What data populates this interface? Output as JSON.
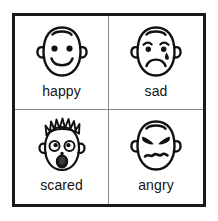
{
  "page": {
    "background_color": "#ffffff",
    "frame_color": "#1a1a1a",
    "divider_color": "#8a8a8a",
    "ink_color": "#111111",
    "layout": "2x2 grid"
  },
  "grid": {
    "columns": 2,
    "rows": 2,
    "cells": [
      {
        "id": "happy",
        "label": "happy",
        "icon_name": "happy-face-icon",
        "position": "top-left",
        "features": {
          "head": "oval outline",
          "ears": "two small side ears",
          "hairline": "small arc at crown",
          "eyes": "two filled dots",
          "eyebrows": "none",
          "mouth": "wide upward smile curve",
          "tear": "none"
        }
      },
      {
        "id": "sad",
        "label": "sad",
        "icon_name": "sad-face-icon",
        "position": "top-right",
        "features": {
          "head": "oval outline",
          "ears": "two small side ears",
          "hairline": "small arc at crown",
          "eyes": "two filled dots under arched brows",
          "eyebrows": "inner ends raised, sloping down outward",
          "mouth": "downward frown curve",
          "tear": "single teardrop below right eye"
        }
      },
      {
        "id": "scared",
        "label": "scared",
        "icon_name": "scared-face-icon",
        "position": "bottom-left",
        "features": {
          "head": "oval outline",
          "ears": "two small side ears",
          "hairline": "spiky hair standing on end",
          "eyes": "two large open circles with small pupils",
          "eyebrows": "none",
          "nose": "small dot",
          "mouth": "open dark oval gasp",
          "tear": "none"
        }
      },
      {
        "id": "angry",
        "label": "angry",
        "icon_name": "angry-face-icon",
        "position": "bottom-right",
        "features": {
          "head": "oval outline",
          "ears": "two small side ears",
          "hairline": "small arc at crown",
          "eyes": "two narrowed slanted eyes",
          "eyebrows": "thick V-shaped brows angled inward and down",
          "mouth": "wavy zigzag line",
          "tear": "none"
        }
      }
    ]
  }
}
